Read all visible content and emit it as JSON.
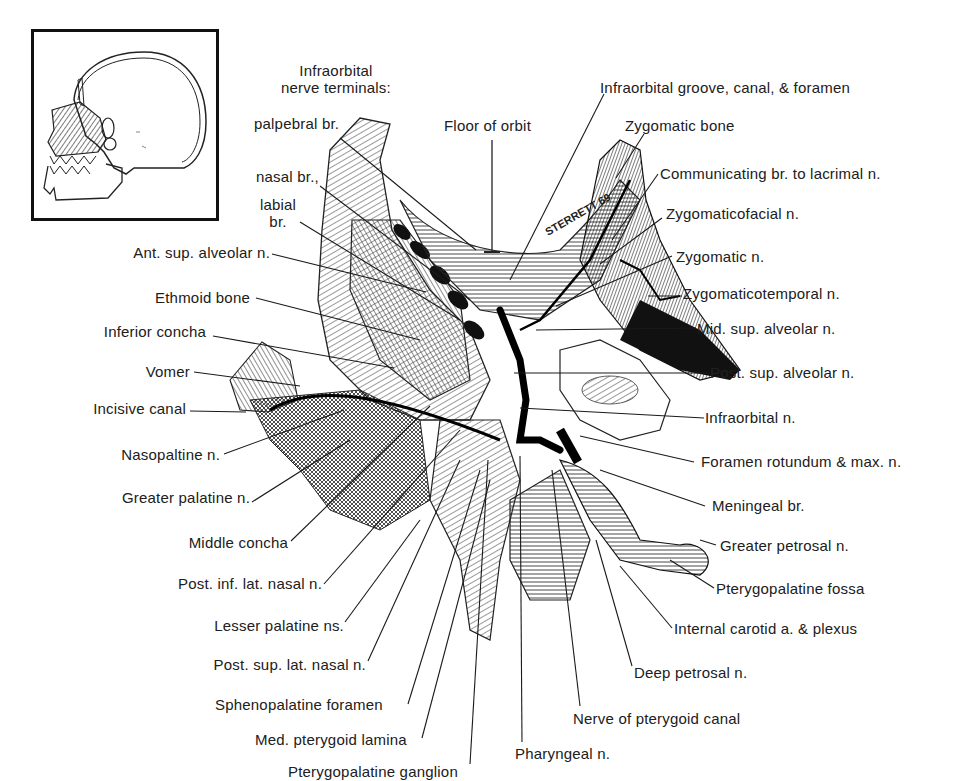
{
  "figure": {
    "type": "anatomical-illustration",
    "signature": "STERRETT 69",
    "inset": {
      "description": "lateral skull with hatched maxillary/nasal region"
    }
  },
  "labels": {
    "top": {
      "infraorbital_header_line1": "Infraorbital",
      "infraorbital_header_line2": "nerve terminals:",
      "palpebral": "palpebral br.",
      "nasal": "nasal br.,",
      "labial_line1": "labial",
      "labial_line2": "br.",
      "floor_of_orbit": "Floor of orbit",
      "infraorbital_groove": "Infraorbital groove, canal, & foramen"
    },
    "right": [
      "Zygomatic bone",
      "Communicating br. to lacrimal n.",
      "Zygomaticofacial n.",
      "Zygomatic n.",
      "Zygomaticotemporal n.",
      "Mid. sup. alveolar n.",
      "Post. sup. alveolar n.",
      "Infraorbital n.",
      "Foramen rotundum & max. n.",
      "Meningeal br.",
      "Greater petrosal n.",
      "Pterygopalatine fossa",
      "Internal carotid a. & plexus",
      "Deep petrosal n.",
      "Nerve of pterygoid canal"
    ],
    "left": [
      "Ant. sup. alveolar n.",
      "Ethmoid bone",
      "Inferior concha",
      "Vomer",
      "Incisive canal",
      "Nasopaltine n.",
      "Greater palatine n.",
      "Middle concha",
      "Post. inf. lat. nasal n.",
      "Lesser palatine ns.",
      "Post. sup. lat. nasal n."
    ],
    "bottom": [
      "Sphenopalatine foramen",
      "Med. pterygoid lamina",
      "Pterygopalatine ganglion",
      "Pharyngeal n."
    ]
  }
}
